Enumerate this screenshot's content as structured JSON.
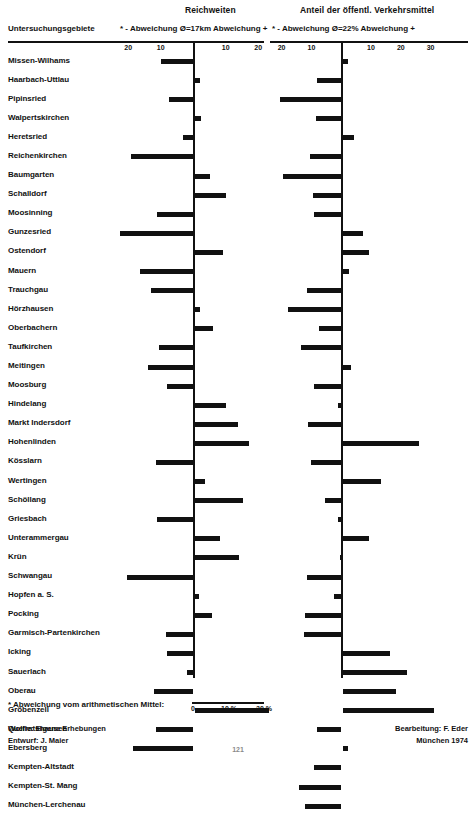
{
  "header": {
    "title_left": "Reichweiten",
    "title_right": "Anteil der öffentl. Verkehrsmittel",
    "column_head": "Untersuchungsgebiete",
    "sub_left": "* - Abweichung  Ø=17km  Abweichung +",
    "sub_right": "* - Abweichung   Ø=22%  Abweichung +"
  },
  "footer": {
    "note": "* Abweichung vom arithmetischen Mittel:",
    "scale_ticks": [
      "0",
      "10 %",
      "20 %"
    ],
    "source_1": "Quelle: Eigene Erhebungen",
    "source_2": "Entwurf: J. Maier",
    "credit_1": "Bearbeitung: F. Eder",
    "credit_2": "München 1974",
    "page_number": "121"
  },
  "chart_data": {
    "type": "bar",
    "orientation": "horizontal-diverging",
    "grid": false,
    "legend_position": "none",
    "panels": [
      {
        "name": "Reichweiten",
        "unit": "km",
        "mean_label": "Ø=17km",
        "mean_value": 17,
        "xlabel": "* - Abweichung  Ø=17km  Abweichung +",
        "axis_ticks": [
          20,
          10,
          0,
          10,
          20
        ],
        "axis_tick_labels": [
          "20",
          "10",
          "",
          "10",
          "20"
        ],
        "xlim": [
          -23,
          25
        ]
      },
      {
        "name": "Anteil der öffentl. Verkehrsmittel",
        "unit": "%",
        "mean_label": "Ø=22%",
        "mean_value": 22,
        "xlabel": "* - Abweichung   Ø=22%  Abweichung +",
        "axis_ticks": [
          20,
          10,
          0,
          10,
          20,
          30
        ],
        "axis_tick_labels": [
          "20",
          "10",
          "",
          "10",
          "20",
          "30"
        ],
        "xlim": [
          -23,
          35
        ]
      }
    ],
    "categories": [
      "Missen-Wilhams",
      "Haarbach-Uttlau",
      "Pipinsried",
      "Walpertskirchen",
      "Heretsried",
      "Reichenkirchen",
      "Baumgarten",
      "Schalldorf",
      "Moosinning",
      "Gunzesried",
      "Ostendorf",
      "Mauern",
      "Trauchgau",
      "Hörzhausen",
      "Oberbachern",
      "Taufkirchen",
      "Meitingen",
      "Moosburg",
      "Hindelang",
      "Markt Indersdorf",
      "Hohenlinden",
      "Kösslarn",
      "Wertingen",
      "Schöllang",
      "Griesbach",
      "Unterammergau",
      "Krün",
      "Schwangau",
      "Hopfen a. S.",
      "Pocking",
      "Garmisch-Partenkirchen",
      "Icking",
      "Sauerlach",
      "Oberau",
      "Gröbenzell",
      "Wolfratshausen",
      "Ebersberg",
      "Kempten-Altstadt",
      "Kempten-St. Mang",
      "München-Lerchenau"
    ],
    "series": [
      {
        "name": "Reichweiten",
        "panel": 0,
        "values": [
          -10.0,
          1.5,
          -7.5,
          1.8,
          -3.0,
          -19.0,
          4.5,
          9.5,
          -11.0,
          -22.5,
          8.5,
          -16.5,
          -13.0,
          1.5,
          5.5,
          -10.5,
          -14.0,
          -8.0,
          9.5,
          13.0,
          16.5,
          -11.5,
          3.0,
          14.5,
          -11.0,
          7.5,
          13.5,
          -20.5,
          1.0,
          5.0,
          -8.5,
          -8.0,
          -2.0,
          -12.0,
          22.5,
          -11.5,
          -18.5,
          0.0,
          0.0,
          0.0
        ]
      },
      {
        "name": "Anteil der öffentl. Verkehrsmittel",
        "panel": 1,
        "values": [
          1.5,
          -8.0,
          -20.5,
          -8.5,
          3.5,
          -10.5,
          -19.5,
          -9.5,
          -9.0,
          6.5,
          8.5,
          2.0,
          -11.5,
          -18.0,
          -7.5,
          -13.5,
          2.5,
          -9.0,
          -1.0,
          -11.0,
          25.5,
          -10.0,
          12.5,
          -5.5,
          -1.0,
          8.5,
          -0.5,
          -11.5,
          -2.5,
          -12.0,
          -12.5,
          15.5,
          21.5,
          17.5,
          30.5,
          -8.0,
          1.5,
          -9.0,
          -14.0,
          -12.0
        ]
      }
    ]
  }
}
